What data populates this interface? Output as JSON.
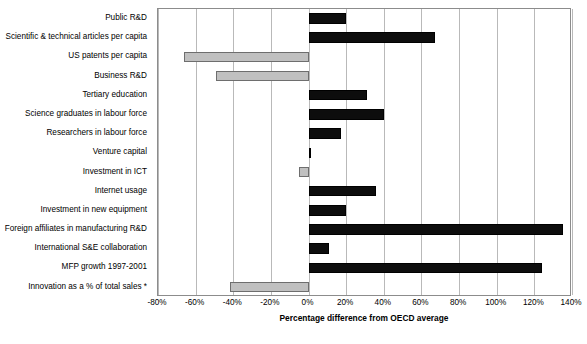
{
  "chart_data": {
    "type": "bar",
    "orientation": "horizontal",
    "title": "",
    "xlabel": "Percentage difference from OECD average",
    "ylabel": "",
    "xlim": [
      -80,
      140
    ],
    "xtick_step": 20,
    "grid": true,
    "legend": "none",
    "xtick_labels": [
      "-80%",
      "-60%",
      "-40%",
      "-20%",
      "0%",
      "20%",
      "40%",
      "60%",
      "80%",
      "100%",
      "120%",
      "140%"
    ],
    "colors": {
      "positive": "#0d0d0d",
      "negative": "#c0c0c0",
      "gridline": "#b9b9b9",
      "axis_border": "#8c8c8c"
    },
    "categories": [
      "Public R&D",
      "Scientific & technical articles per capita",
      "US patents per capita",
      "Business R&D",
      "Tertiary education",
      "Science graduates in labour force",
      "Researchers in labour force",
      "Venture capital",
      "Investment in ICT",
      "Internet usage",
      "Investment in new equipment",
      "Foreign affiliates in manufacturing R&D",
      "International S&E collaboration",
      "MFP growth 1997-2001",
      "Innovation as a % of total sales *"
    ],
    "values": [
      20,
      67,
      -66,
      -49,
      31,
      40,
      17,
      1,
      -5,
      36,
      20,
      135,
      11,
      124,
      -42
    ]
  }
}
